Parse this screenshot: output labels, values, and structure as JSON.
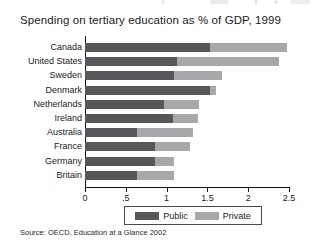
{
  "chart_data": {
    "type": "bar",
    "orientation": "horizontal",
    "stacked": true,
    "title": "Spending on tertiary education as % of GDP, 1999",
    "xlabel": "",
    "ylabel": "",
    "xlim": [
      0,
      2.5
    ],
    "grid": false,
    "legend_position": "bottom",
    "xticks": [
      "0",
      ".5",
      "1",
      "1.5",
      "2",
      "2.5"
    ],
    "xtick_values": [
      0,
      0.5,
      1,
      1.5,
      2,
      2.5
    ],
    "categories": [
      "Canada",
      "United States",
      "Sweden",
      "Denmark",
      "Netherlands",
      "Ireland",
      "Australia",
      "France",
      "Germany",
      "Britain"
    ],
    "series": [
      {
        "name": "Public",
        "color": "#57575a",
        "values": [
          1.53,
          1.13,
          1.09,
          1.53,
          0.97,
          1.08,
          0.64,
          0.86,
          0.86,
          0.64
        ]
      },
      {
        "name": "Private",
        "color": "#a8a8ab",
        "values": [
          0.94,
          1.25,
          0.59,
          0.08,
          0.43,
          0.31,
          0.68,
          0.43,
          0.23,
          0.45
        ]
      }
    ],
    "totals": [
      2.47,
      2.38,
      1.68,
      1.61,
      1.4,
      1.39,
      1.32,
      1.29,
      1.09,
      1.09
    ],
    "source": "Source: OECD, Education at a Glance 2002"
  },
  "legend": {
    "public_label": "Public",
    "private_label": "Private"
  }
}
